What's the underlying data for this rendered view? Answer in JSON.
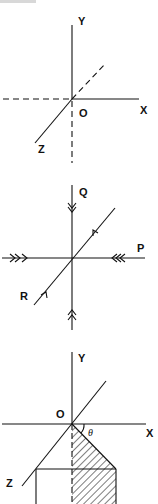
{
  "header_fragment": "",
  "figures": [
    {
      "id": "axes-xyz",
      "labels": {
        "y": "Y",
        "x": "X",
        "z": "Z",
        "origin": "O"
      }
    },
    {
      "id": "three-forces",
      "labels": {
        "q": "Q",
        "p": "P",
        "r": "R"
      }
    },
    {
      "id": "rotated-plane",
      "labels": {
        "y": "Y",
        "x": "X",
        "z": "Z",
        "origin": "O",
        "angle": "θ"
      }
    }
  ],
  "colors": {
    "line": "#111111",
    "background": "#ffffff"
  }
}
